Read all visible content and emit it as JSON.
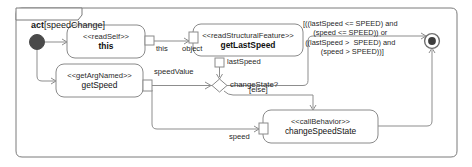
{
  "diagram": {
    "kind": "uml-activity-diagram",
    "frame": {
      "keyword": "act",
      "open_bracket": "[",
      "name": "speedChange",
      "close_bracket": "]"
    },
    "nodes": {
      "initial": {
        "name": "initial-node",
        "label": ""
      },
      "read_self": {
        "stereotype": "<<readSelf>>",
        "name": "this",
        "bold": true,
        "output_pin": "this"
      },
      "get_arg_named": {
        "stereotype": "<<getArgNamed>>",
        "name": "getSpeed",
        "bold": false,
        "output_pin": "speedValue"
      },
      "get_last_speed": {
        "stereotype": "<<readStructuralFeature>>",
        "name": "getLastSpeed",
        "bold": true,
        "input_pin": "object",
        "output_pin": "lastSpeed"
      },
      "change_speed_state": {
        "stereotype": "<<callBehavior>>",
        "name": "changeSpeedState",
        "bold": false,
        "input_pin": "speed"
      },
      "decision": {
        "label": "changeState?"
      },
      "final": {
        "name": "activity-final-node",
        "label": ""
      }
    },
    "edges": {
      "guard_true": "[((lastSpeed <= SPEED) and\n(speed <= SPEED)) or\n((lastSpeed >  SPEED) and\n  (speed > SPEED))]",
      "guard_else": "[else]"
    },
    "colors": {
      "stroke": "#8a8a8a",
      "frame_stroke": "#7a7a7a",
      "node_fill": "#ffffff",
      "initial_fill": "#4a4a4a",
      "final_fill": "#3d3d3d",
      "text": "#1a1a1a",
      "background": "#ffffff"
    }
  }
}
